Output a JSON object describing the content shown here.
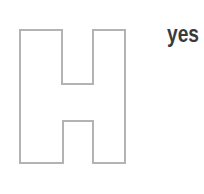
{
  "canvas": {
    "width": 204,
    "height": 194,
    "background_color": "#ffffff"
  },
  "figure": {
    "name": "letter-H-outline",
    "letter": "H",
    "stroke_color": "#b2b4b4",
    "fill_color": "#ffffff",
    "points": "20,30 62,30 62,84 93,84 93,30 125,30 125,163 93,163 93,121 63,121 63,163 20,163"
  },
  "label": {
    "text": "yes",
    "color": "#3a3a3a"
  }
}
